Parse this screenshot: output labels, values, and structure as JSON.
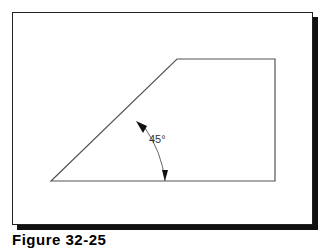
{
  "figure": {
    "caption": "Figure 32-25",
    "angle_label": "45°",
    "colors": {
      "line": "#555555",
      "frame": "#222222",
      "shadow": "#111111",
      "background": "#ffffff"
    },
    "shape": {
      "description": "Trapezoid with 45-degree chamfered left side",
      "vertices": [
        [
          51,
          181
        ],
        [
          177,
          59
        ],
        [
          275,
          59
        ],
        [
          275,
          181
        ]
      ]
    },
    "dimension": {
      "type": "angular",
      "value": "45°",
      "between": [
        "slanted edge",
        "bottom edge"
      ]
    }
  }
}
